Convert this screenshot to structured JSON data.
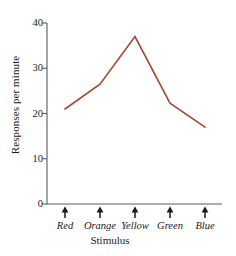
{
  "chart_data": {
    "type": "line",
    "title": "",
    "xlabel": "Stimulus",
    "ylabel": "Responses per minute",
    "categories": [
      "Red",
      "Orange",
      "Yellow",
      "Green",
      "Blue"
    ],
    "values": [
      21,
      26.5,
      37,
      22.3,
      17
    ],
    "series": [
      {
        "name": "Responses per minute",
        "values": [
          21,
          26.5,
          37,
          22.3,
          17
        ]
      }
    ],
    "ylim": [
      0,
      40
    ],
    "yticks": [
      0,
      10,
      20,
      30,
      40
    ],
    "ytick_labels": [
      "0",
      "10",
      "20",
      "30",
      "40"
    ],
    "grid": false,
    "legend": false,
    "legend_position": "none",
    "line_color": "#9e4a35",
    "line_width": 1.6,
    "markers": false,
    "axis_color": "#5a5a5a",
    "x_category_markers": "up-arrow",
    "annotations": []
  },
  "axes": {
    "y_title": "Responses per minute",
    "x_title": "Stimulus",
    "y_tick_0": "0",
    "y_tick_1": "10",
    "y_tick_2": "20",
    "y_tick_3": "30",
    "y_tick_4": "40",
    "x_tick_0": "Red",
    "x_tick_1": "Orange",
    "x_tick_2": "Yellow",
    "x_tick_3": "Green",
    "x_tick_4": "Blue"
  }
}
